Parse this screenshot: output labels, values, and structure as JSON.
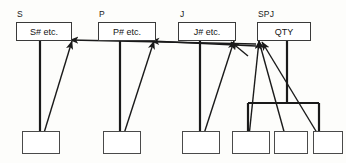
{
  "diagram": {
    "background_color": "#fdfdfb",
    "line_color": "#1a1a1a",
    "box_border_color": "#3a3a3a",
    "relvars": [
      {
        "name": "s-relvar",
        "label": "S",
        "label_x": 17,
        "label_y": 10,
        "box_x": 16,
        "box_y": 22,
        "box_w": 56,
        "box_h": 19,
        "attributes": "S# etc."
      },
      {
        "name": "p-relvar",
        "label": "P",
        "label_x": 99,
        "label_y": 10,
        "box_x": 98,
        "box_y": 22,
        "box_w": 58,
        "box_h": 19,
        "attributes": "P# etc."
      },
      {
        "name": "j-relvar",
        "label": "J",
        "label_x": 180,
        "label_y": 10,
        "box_x": 178,
        "box_y": 22,
        "box_w": 58,
        "box_h": 19,
        "attributes": "J# etc."
      },
      {
        "name": "spj-relvar",
        "label": "SPJ",
        "label_x": 258,
        "label_y": 10,
        "box_x": 257,
        "box_y": 22,
        "box_w": 54,
        "box_h": 19,
        "attributes": "QTY"
      }
    ],
    "leaf_boxes": [
      {
        "name": "leaf-box-1",
        "x": 22,
        "y": 131,
        "w": 38,
        "h": 23
      },
      {
        "name": "leaf-box-2",
        "x": 103,
        "y": 131,
        "w": 38,
        "h": 23
      },
      {
        "name": "leaf-box-3",
        "x": 182,
        "y": 131,
        "w": 38,
        "h": 23
      },
      {
        "name": "leaf-box-4",
        "x": 232,
        "y": 131,
        "w": 38,
        "h": 23
      },
      {
        "name": "leaf-box-5",
        "x": 274,
        "y": 131,
        "w": 34,
        "h": 23
      },
      {
        "name": "leaf-box-6",
        "x": 313,
        "y": 131,
        "w": 30,
        "h": 23
      }
    ],
    "stems": [
      {
        "name": "stem-s",
        "x": 40,
        "y1": 41,
        "y2": 131
      },
      {
        "name": "stem-p",
        "x": 120,
        "y1": 41,
        "y2": 131
      },
      {
        "name": "stem-j",
        "x": 200,
        "y1": 41,
        "y2": 131
      },
      {
        "name": "stem-spj",
        "x": 287,
        "y1": 41,
        "y2": 103
      }
    ],
    "bracket": {
      "name": "spj-bracket",
      "left_x": 248,
      "right_x": 319,
      "bar_y": 103,
      "drop_bottom_y": 131
    },
    "arrows": [
      {
        "name": "arrow-leaf1-to-s",
        "x1": 40,
        "y1": 146,
        "x2": 72,
        "y2": 41
      },
      {
        "name": "arrow-leaf2-to-p",
        "x1": 120,
        "y1": 146,
        "x2": 154,
        "y2": 41
      },
      {
        "name": "arrow-leaf3-to-j",
        "x1": 200,
        "y1": 146,
        "x2": 234,
        "y2": 41
      },
      {
        "name": "arrow-leaf4-to-spj",
        "x1": 248,
        "y1": 146,
        "x2": 259,
        "y2": 41
      },
      {
        "name": "arrow-leaf5-to-spj",
        "x1": 288,
        "y1": 146,
        "x2": 259,
        "y2": 41
      },
      {
        "name": "arrow-leaf6-to-spj",
        "x1": 325,
        "y1": 146,
        "x2": 262,
        "y2": 42
      },
      {
        "name": "arrow-spj-left-to-s",
        "x1": 256,
        "y1": 44,
        "x2": 70,
        "y2": 40
      },
      {
        "name": "arrow-spj-left-to-p",
        "x1": 256,
        "y1": 46,
        "x2": 151,
        "y2": 41
      },
      {
        "name": "arrow-spj-left-to-j",
        "x1": 248,
        "y1": 56,
        "x2": 231,
        "y2": 42
      }
    ]
  }
}
